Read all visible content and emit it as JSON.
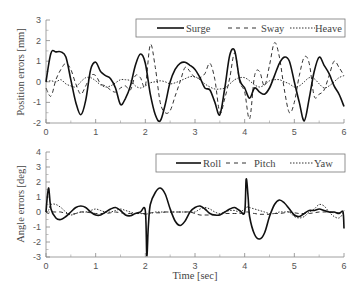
{
  "figure": {
    "xlabel": "Time [sec]"
  },
  "chart_data": [
    {
      "type": "line",
      "title": "",
      "xlabel": "",
      "ylabel": "Position errors [mm]",
      "xlim": [
        0,
        6
      ],
      "ylim": [
        -2,
        3
      ],
      "xticks": [
        0,
        1,
        2,
        3,
        4,
        5,
        6
      ],
      "yticks": [
        -2,
        -1,
        0,
        1,
        2,
        3
      ],
      "grid": false,
      "legend_position": "upper right",
      "x": [
        0,
        0.1,
        0.2,
        0.3,
        0.4,
        0.5,
        0.6,
        0.7,
        0.8,
        0.9,
        1.0,
        1.1,
        1.2,
        1.3,
        1.4,
        1.5,
        1.6,
        1.7,
        1.8,
        1.9,
        2.0,
        2.1,
        2.2,
        2.3,
        2.4,
        2.5,
        2.6,
        2.7,
        2.8,
        2.9,
        3.0,
        3.1,
        3.2,
        3.3,
        3.4,
        3.5,
        3.6,
        3.7,
        3.8,
        3.9,
        4.0,
        4.1,
        4.2,
        4.3,
        4.4,
        4.5,
        4.6,
        4.7,
        4.8,
        4.9,
        5.0,
        5.1,
        5.2,
        5.3,
        5.4,
        5.5,
        5.6,
        5.7,
        5.8,
        5.9,
        6.0
      ],
      "series": [
        {
          "name": "Surge",
          "style": "solid",
          "values": [
            0.0,
            1.4,
            1.45,
            1.45,
            1.2,
            0.1,
            -1.0,
            -1.6,
            -0.9,
            0.6,
            0.95,
            0.5,
            0.3,
            0.15,
            -0.3,
            -1.1,
            -0.8,
            -0.2,
            0.8,
            1.35,
            0.9,
            -0.6,
            -1.6,
            -1.9,
            -1.1,
            0.0,
            0.6,
            0.9,
            0.95,
            0.8,
            0.6,
            0.2,
            -0.3,
            -0.4,
            -1.0,
            -1.6,
            -0.3,
            1.3,
            1.5,
            0.1,
            -0.3,
            -0.8,
            -0.3,
            -0.5,
            -0.6,
            -0.3,
            0.3,
            0.9,
            1.2,
            1.0,
            0.0,
            -1.0,
            -1.9,
            -0.8,
            0.5,
            1.2,
            0.8,
            0.4,
            -0.2,
            -0.6,
            -1.2
          ]
        },
        {
          "name": "Sway",
          "style": "dashed",
          "values": [
            -0.3,
            -0.7,
            0.1,
            0.6,
            0.9,
            0.6,
            -0.1,
            -0.6,
            -0.2,
            0.3,
            0.3,
            -0.1,
            -0.2,
            -0.4,
            -0.5,
            -0.3,
            -0.2,
            -0.4,
            0.3,
            0.2,
            -0.2,
            1.8,
            0.7,
            -1.0,
            -1.5,
            -1.4,
            -0.7,
            0.0,
            0.7,
            0.5,
            0.2,
            0.2,
            0.4,
            0.9,
            0.1,
            -1.5,
            -0.8,
            0.2,
            1.4,
            0.0,
            -0.5,
            -1.8,
            0.3,
            0.5,
            -0.2,
            0.8,
            1.9,
            1.2,
            -0.4,
            -1.5,
            -1.0,
            0.3,
            1.2,
            0.9,
            -0.7,
            -0.6,
            -0.4,
            0.3,
            1.0,
            0.7,
            0.3
          ]
        },
        {
          "name": "Heave",
          "style": "dotted",
          "values": [
            0.0,
            0.05,
            0.0,
            0.1,
            -0.1,
            -0.2,
            -0.25,
            0.0,
            0.2,
            0.2,
            0.05,
            -0.15,
            -0.25,
            -0.2,
            -0.05,
            0.1,
            0.1,
            0.05,
            -0.2,
            -0.3,
            -0.2,
            -0.05,
            0.0,
            0.05,
            0.0,
            -0.1,
            -0.05,
            0.05,
            0.15,
            0.25,
            0.25,
            0.1,
            -0.1,
            -0.25,
            -0.35,
            -0.35,
            -0.3,
            -0.1,
            0.1,
            0.2,
            0.2,
            0.05,
            -0.15,
            -0.25,
            -0.15,
            0.05,
            0.1,
            0.1,
            0.0,
            -0.1,
            -0.25,
            -0.2,
            0.0,
            0.2,
            0.15,
            -0.1,
            -0.3,
            -0.2,
            0.0,
            0.2,
            0.3
          ]
        }
      ]
    },
    {
      "type": "line",
      "title": "",
      "xlabel": "Time [sec]",
      "ylabel": "Angle errors [deg]",
      "xlim": [
        0,
        6
      ],
      "ylim": [
        -3,
        4
      ],
      "xticks": [
        0,
        1,
        2,
        3,
        4,
        5,
        6
      ],
      "yticks": [
        -3,
        -2,
        -1,
        0,
        1,
        2,
        3,
        4
      ],
      "grid": false,
      "legend_position": "upper right",
      "x": [
        0,
        0.05,
        0.1,
        0.2,
        0.3,
        0.4,
        0.5,
        0.6,
        0.7,
        0.8,
        0.9,
        1.0,
        1.1,
        1.2,
        1.3,
        1.4,
        1.5,
        1.6,
        1.7,
        1.8,
        1.9,
        2.0,
        2.03,
        2.06,
        2.1,
        2.2,
        2.3,
        2.4,
        2.5,
        2.6,
        2.7,
        2.8,
        2.9,
        3.0,
        3.1,
        3.2,
        3.3,
        3.4,
        3.5,
        3.6,
        3.7,
        3.8,
        3.9,
        4.0,
        4.03,
        4.07,
        4.1,
        4.2,
        4.3,
        4.4,
        4.5,
        4.6,
        4.7,
        4.8,
        4.9,
        5.0,
        5.1,
        5.2,
        5.3,
        5.4,
        5.5,
        5.6,
        5.7,
        5.8,
        5.9,
        5.98,
        6.0
      ],
      "series": [
        {
          "name": "Roll",
          "style": "solid",
          "values": [
            0.0,
            1.6,
            0.2,
            -0.4,
            -0.5,
            -0.3,
            0.0,
            0.3,
            0.4,
            0.3,
            0.0,
            -0.2,
            -0.2,
            0.0,
            0.2,
            0.3,
            0.1,
            -0.2,
            -0.25,
            -0.1,
            0.0,
            0.1,
            -2.9,
            -1.0,
            0.5,
            1.3,
            1.6,
            1.2,
            0.2,
            -0.6,
            -0.9,
            -0.6,
            0.0,
            0.3,
            0.4,
            0.2,
            -0.1,
            -0.2,
            -0.2,
            0.0,
            0.2,
            0.3,
            0.1,
            0.0,
            2.2,
            1.0,
            -0.3,
            -1.5,
            -1.8,
            -1.4,
            -0.3,
            0.5,
            0.8,
            0.6,
            0.2,
            -0.2,
            -0.3,
            -0.1,
            0.1,
            0.1,
            0.2,
            0.1,
            0.0,
            0.0,
            -0.1,
            0.0,
            -1.1
          ]
        },
        {
          "name": "Pitch",
          "style": "dashed",
          "values": [
            0.0,
            -0.1,
            0.0,
            0.0,
            0.0,
            -0.1,
            -0.15,
            -0.1,
            0.0,
            0.0,
            -0.05,
            -0.1,
            -0.1,
            -0.1,
            -0.05,
            0.0,
            -0.05,
            -0.1,
            -0.1,
            -0.1,
            -0.1,
            -0.1,
            -0.1,
            -0.1,
            -0.05,
            -0.05,
            -0.05,
            0.0,
            0.0,
            0.0,
            0.0,
            0.0,
            0.0,
            -0.1,
            -0.2,
            -0.2,
            -0.2,
            -0.2,
            -0.15,
            -0.1,
            -0.1,
            -0.1,
            -0.1,
            -0.05,
            0.0,
            0.0,
            -0.05,
            -0.1,
            -0.15,
            -0.15,
            -0.15,
            -0.1,
            -0.1,
            -0.05,
            0.0,
            -0.05,
            -0.1,
            -0.1,
            -0.1,
            -0.05,
            0.0,
            0.0,
            0.0,
            -0.05,
            -0.05,
            0.0,
            0.0
          ]
        },
        {
          "name": "Yaw",
          "style": "dotted",
          "values": [
            0.0,
            0.1,
            0.5,
            0.5,
            0.3,
            0.0,
            -0.2,
            -0.1,
            0.0,
            0.0,
            0.1,
            0.2,
            0.1,
            0.0,
            0.0,
            0.1,
            0.2,
            0.1,
            0.0,
            -0.1,
            -0.1,
            -0.15,
            -0.15,
            -0.1,
            -0.1,
            0.0,
            0.0,
            0.0,
            0.0,
            0.0,
            0.0,
            0.0,
            0.0,
            0.0,
            0.2,
            0.3,
            0.2,
            0.0,
            -0.1,
            0.0,
            0.1,
            0.1,
            0.0,
            0.2,
            0.3,
            0.35,
            0.3,
            0.2,
            0.1,
            0.0,
            -0.1,
            -0.1,
            0.0,
            0.0,
            0.0,
            -0.3,
            -0.4,
            -0.3,
            0.0,
            0.2,
            0.5,
            0.4,
            0.0,
            -0.3,
            -0.4,
            -0.1,
            0.1
          ]
        }
      ]
    }
  ]
}
